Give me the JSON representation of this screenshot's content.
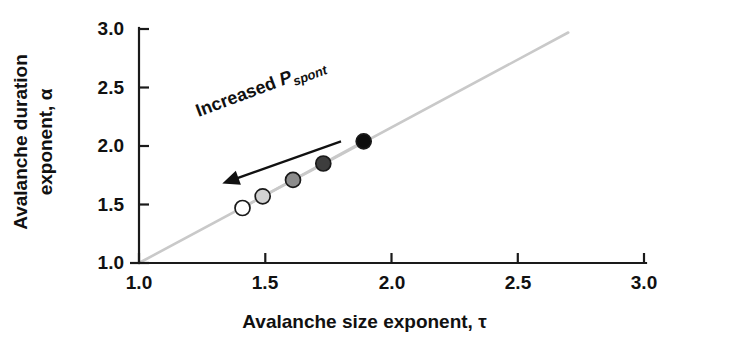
{
  "chart_data": {
    "type": "scatter",
    "title": "",
    "xlabel": "Avalanche size exponent, τ",
    "ylabel_line1": "Avalanche duration",
    "ylabel_line2": "exponent, α",
    "xlim": [
      1.0,
      3.0
    ],
    "ylim": [
      1.0,
      3.0
    ],
    "xticks": [
      "1.0",
      "1.5",
      "2.0",
      "2.5",
      "3.0"
    ],
    "xtick_values": [
      1.0,
      1.5,
      2.0,
      2.5,
      3.0
    ],
    "yticks": [
      "1.0",
      "1.5",
      "2.0",
      "2.5",
      "3.0"
    ],
    "ytick_values": [
      1.0,
      1.5,
      2.0,
      2.5,
      3.0
    ],
    "grid": false,
    "legend": "none",
    "series": [
      {
        "name": "Avalanche exponents vs spontaneous activity",
        "x": [
          1.41,
          1.49,
          1.61,
          1.73,
          1.89
        ],
        "y": [
          1.47,
          1.57,
          1.71,
          1.85,
          2.04
        ],
        "marker_fills": [
          "#ffffff",
          "#d2d2d2",
          "#8c8c8c",
          "#3d3d3d",
          "#0d0d0d"
        ],
        "marker_edge": "#1a1a1a",
        "marker_radius": 7.5,
        "connected": true,
        "connector_color": "#c9c9c9"
      }
    ],
    "reference_line": {
      "name": "identity-line",
      "equation": "alpha = tau",
      "from": [
        1.0,
        1.0
      ],
      "to": [
        2.7,
        2.97
      ],
      "color": "#c9c9c9"
    },
    "annotations": [
      {
        "name": "increased-pspont-arrow",
        "text_prefix": "Increased ",
        "text_italic": "P",
        "text_sub": "spont",
        "arrow_from": [
          1.8,
          2.04
        ],
        "arrow_to": [
          1.33,
          1.68
        ],
        "rotation_deg": -20.5,
        "color": "#111111"
      }
    ],
    "axis_color": "#1a1a1a",
    "background": "#ffffff"
  },
  "geometry": {
    "plot_left_px": 139,
    "plot_bottom_px": 263,
    "px_per_x_unit": 252.5,
    "px_per_y_unit": 117.0,
    "axis_top_px": 29,
    "axis_right_px": 645
  }
}
